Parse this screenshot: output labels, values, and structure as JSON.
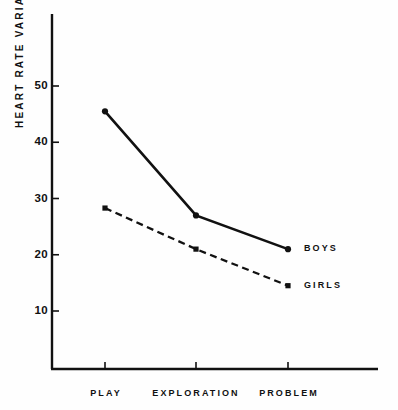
{
  "chart_data": {
    "type": "line",
    "title": "",
    "subtitle": "",
    "xlabel": "",
    "ylabel": "HEART RATE VARIANCE",
    "categories": [
      "PLAY",
      "EXPLORATION",
      "PROBLEM"
    ],
    "series": [
      {
        "name": "BOYS",
        "values": [
          45.5,
          27.0,
          21.0
        ],
        "style": "solid",
        "marker": "filled-circle",
        "color": "#111111"
      },
      {
        "name": "GIRLS",
        "values": [
          28.3,
          21.0,
          14.5
        ],
        "style": "dashed",
        "marker": "filled-square",
        "color": "#111111"
      }
    ],
    "ylim": [
      0,
      57
    ],
    "yticks": [
      10,
      20,
      30,
      40,
      50
    ],
    "ytick_labels": [
      "10",
      "20",
      "30",
      "40",
      "50"
    ],
    "grid": false,
    "legend": "inline-right-of-last-point",
    "legend_entries": [
      "BOYS",
      "GIRLS"
    ]
  },
  "axes": {
    "y_title": "HEART RATE VARIANCE",
    "y_tick_labels": [
      "50",
      "40",
      "30",
      "20",
      "10"
    ],
    "x_tick_labels": [
      "PLAY",
      "EXPLORATION",
      "PROBLEM"
    ]
  },
  "labels": {
    "boys": "BOYS",
    "girls": "GIRLS"
  },
  "colors": {
    "ink": "#111111",
    "background": "#fefefe"
  }
}
